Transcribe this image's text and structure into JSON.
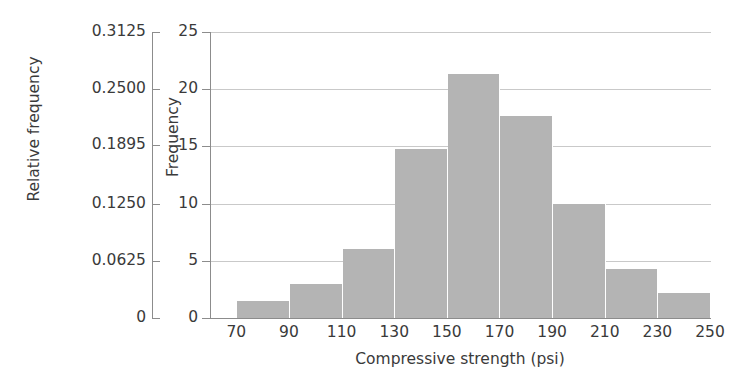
{
  "chart_data": {
    "type": "bar",
    "title": "",
    "subtitle": "",
    "xlabel": "Compressive strength (psi)",
    "ylabel": "Frequency",
    "y2label": "Relative frequency",
    "grid": true,
    "legend": null,
    "xlim": [
      60,
      250
    ],
    "ylim": [
      0,
      25
    ],
    "y2lim": [
      0,
      0.3125
    ],
    "bin_width": 20,
    "bin_edges": [
      70,
      90,
      110,
      130,
      150,
      170,
      190,
      210,
      230,
      250
    ],
    "categories": [
      "70-90",
      "90-110",
      "110-130",
      "130-150",
      "150-170",
      "170-190",
      "190-210",
      "210-230",
      "230-250"
    ],
    "values": [
      1.5,
      3.0,
      6.0,
      14.8,
      21.3,
      17.7,
      10.0,
      4.3,
      2.2
    ],
    "relative_values": [
      0.0188,
      0.0375,
      0.075,
      0.185,
      0.2663,
      0.2213,
      0.125,
      0.0538,
      0.0275
    ],
    "bar_color": "#b4b4b4",
    "bar_edge_color": "#ffffff",
    "grid_color": "#c9c9c9",
    "axis_color": "#8c8c8c",
    "x_ticks": [
      {
        "label": "70",
        "value": 70
      },
      {
        "label": "90",
        "value": 90
      },
      {
        "label": "110",
        "value": 110
      },
      {
        "label": "130",
        "value": 130
      },
      {
        "label": "150",
        "value": 150
      },
      {
        "label": "170",
        "value": 170
      },
      {
        "label": "190",
        "value": 190
      },
      {
        "label": "210",
        "value": 210
      },
      {
        "label": "230",
        "value": 230
      },
      {
        "label": "250",
        "value": 250
      }
    ],
    "y_ticks": [
      {
        "label": "0",
        "value": 0
      },
      {
        "label": "5",
        "value": 5
      },
      {
        "label": "10",
        "value": 10
      },
      {
        "label": "15",
        "value": 15
      },
      {
        "label": "20",
        "value": 20
      },
      {
        "label": "25",
        "value": 25
      }
    ],
    "y2_ticks": [
      {
        "label": "0",
        "value": 0
      },
      {
        "label": "0.0625",
        "value": 0.0625
      },
      {
        "label": "0.1250",
        "value": 0.125
      },
      {
        "label": "0.1895",
        "value": 0.1895
      },
      {
        "label": "0.2500",
        "value": 0.25
      },
      {
        "label": "0.3125",
        "value": 0.3125
      }
    ]
  }
}
